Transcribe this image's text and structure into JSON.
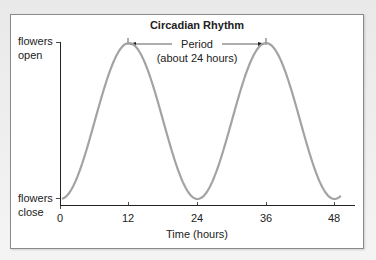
{
  "chart_data": {
    "type": "line",
    "title": "Circadian Rhythm",
    "xlabel": "Time (hours)",
    "ylabel": "",
    "x_ticks": [
      0,
      12,
      24,
      36,
      48
    ],
    "xlim": [
      0,
      50
    ],
    "y_tick_labels": {
      "top": [
        "flowers",
        "open"
      ],
      "bottom": [
        "flowers",
        "close"
      ]
    },
    "ylim": [
      0,
      1
    ],
    "grid": false,
    "legend": null,
    "series": [
      {
        "name": "Flower opening",
        "color": "#a3a3a3",
        "x": [
          0,
          3,
          6,
          9,
          12,
          15,
          18,
          21,
          24,
          27,
          30,
          33,
          36,
          39,
          42,
          45,
          48,
          50
        ],
        "values": [
          0.0,
          0.15,
          0.5,
          0.85,
          1.0,
          0.85,
          0.5,
          0.15,
          0.0,
          0.15,
          0.5,
          0.85,
          1.0,
          0.85,
          0.5,
          0.15,
          0.0,
          0.04
        ]
      }
    ],
    "annotations": [
      {
        "type": "double-arrow",
        "from_x": 12,
        "to_x": 36,
        "label_line1": "Period",
        "label_line2": "(about 24 hours)"
      }
    ]
  },
  "labels": {
    "title": "Circadian Rhythm",
    "y_top_1": "flowers",
    "y_top_2": "open",
    "y_bottom_1": "flowers",
    "y_bottom_2": "close",
    "x_tick_0": "0",
    "x_tick_12": "12",
    "x_tick_24": "24",
    "x_tick_36": "36",
    "x_tick_48": "48",
    "x_axis_label": "Time (hours)",
    "period_label": "Period",
    "period_sub": "(about 24 hours)"
  }
}
